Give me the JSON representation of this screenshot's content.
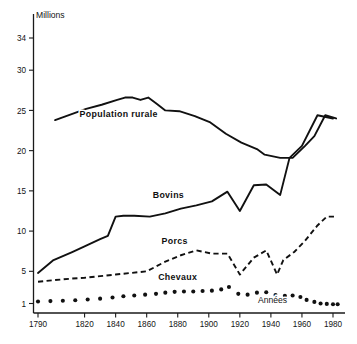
{
  "chart_data": {
    "type": "line",
    "title": "",
    "xlabel": "Années",
    "ylabel": "Millions",
    "unit_label": "Millions",
    "xaxis_label": "Années",
    "xlim": [
      1790,
      1983
    ],
    "ylim": [
      0.2,
      35.5
    ],
    "grid": false,
    "legend_position": "inline-labels",
    "y_ticks": [
      1,
      5,
      10,
      15,
      20,
      25,
      30,
      34
    ],
    "y_tick_labels": [
      "1",
      "5",
      "10",
      "15",
      "20",
      "25",
      "30",
      "34"
    ],
    "x_ticks": [
      1790,
      1820,
      1840,
      1860,
      1880,
      1900,
      1920,
      1940,
      1960,
      1980
    ],
    "x_tick_labels": [
      "1790",
      "1820",
      "1840",
      "1860",
      "1880",
      "1900",
      "1920",
      "1940",
      "1960",
      "1980"
    ],
    "series": [
      {
        "name": "Population rurale",
        "style": "solid",
        "label_x": 1842,
        "label_y": 24.2,
        "x": [
          1801,
          1821,
          1831,
          1841,
          1846,
          1851,
          1856,
          1861,
          1866,
          1872,
          1881,
          1891,
          1901,
          1911,
          1921,
          1931,
          1936,
          1946,
          1954,
          1962,
          1968,
          1975,
          1982
        ],
        "values": [
          23.8,
          25.2,
          25.7,
          26.3,
          26.6,
          26.6,
          26.3,
          26.6,
          25.9,
          25.0,
          24.9,
          24.3,
          23.5,
          22.1,
          21.0,
          20.2,
          19.5,
          19.1,
          19.1,
          20.6,
          21.8,
          24.4,
          24.0
        ]
      },
      {
        "name": "Bovins",
        "style": "solid",
        "label_x": 1874,
        "label_y": 14.1,
        "x": [
          1790,
          1800,
          1812,
          1820,
          1830,
          1835,
          1840,
          1845,
          1852,
          1862,
          1872,
          1882,
          1892,
          1902,
          1912,
          1920,
          1929,
          1937,
          1946,
          1952,
          1960,
          1970,
          1980
        ],
        "values": [
          4.8,
          6.4,
          7.4,
          8.1,
          9.0,
          9.4,
          11.8,
          11.9,
          11.9,
          11.8,
          12.2,
          12.8,
          13.2,
          13.7,
          14.9,
          12.5,
          15.7,
          15.8,
          14.5,
          19.1,
          20.6,
          24.4,
          24.0
        ]
      },
      {
        "name": "Porcs",
        "style": "dashed",
        "label_x": 1878,
        "label_y": 8.4,
        "x": [
          1790,
          1800,
          1812,
          1820,
          1830,
          1840,
          1850,
          1860,
          1866,
          1872,
          1882,
          1892,
          1902,
          1912,
          1920,
          1929,
          1937,
          1944,
          1948,
          1955,
          1962,
          1970,
          1976,
          1982
        ],
        "values": [
          3.7,
          3.9,
          4.1,
          4.2,
          4.4,
          4.6,
          4.8,
          5.0,
          5.6,
          6.2,
          7.0,
          7.6,
          7.2,
          7.2,
          4.6,
          6.7,
          7.6,
          4.6,
          6.4,
          7.4,
          8.8,
          10.7,
          11.8,
          11.8
        ]
      },
      {
        "name": "Chevaux",
        "style": "dotted",
        "label_x": 1880,
        "label_y": 3.9,
        "x": [
          1790,
          1798,
          1806,
          1814,
          1822,
          1830,
          1838,
          1845,
          1852,
          1859,
          1866,
          1872,
          1878,
          1884,
          1890,
          1896,
          1902,
          1908,
          1913,
          1919,
          1925,
          1931,
          1937,
          1943,
          1949,
          1954,
          1959,
          1963,
          1968,
          1972,
          1976,
          1980,
          1983
        ],
        "values": [
          1.25,
          1.3,
          1.35,
          1.4,
          1.5,
          1.6,
          1.75,
          1.9,
          2.0,
          2.1,
          2.2,
          2.35,
          2.45,
          2.5,
          2.5,
          2.55,
          2.6,
          2.75,
          3.05,
          2.2,
          2.1,
          2.35,
          2.4,
          2.05,
          1.95,
          2.0,
          1.8,
          1.45,
          1.2,
          1.0,
          0.95,
          0.9,
          0.9
        ]
      }
    ],
    "annotations": [
      {
        "text": "Millions",
        "x_px": 36,
        "y_px": 18
      },
      {
        "text": "Années",
        "x_px": 258,
        "y_px": 303
      }
    ]
  }
}
